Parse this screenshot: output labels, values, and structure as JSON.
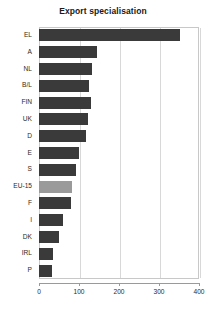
{
  "chart_data": {
    "type": "bar",
    "orientation": "horizontal",
    "title": "Export specialisation",
    "xlabel": "",
    "ylabel": "",
    "categories": [
      "EL",
      "A",
      "NL",
      "B/L",
      "FIN",
      "UK",
      "D",
      "E",
      "S",
      "EU-15",
      "F",
      "I",
      "DK",
      "IRL",
      "P"
    ],
    "values": [
      352,
      146,
      133,
      126,
      129,
      123,
      118,
      101,
      93,
      83,
      80,
      60,
      51,
      34,
      33
    ],
    "xlim": [
      0,
      400
    ],
    "xticks": [
      0,
      100,
      200,
      300,
      400
    ],
    "xtick_labels": [
      "0",
      "100",
      "200",
      "300",
      "400"
    ],
    "grid": true,
    "grid_axis": "x",
    "legend": false,
    "highlight_category": "EU-15",
    "colors": {
      "bar": "#3a3a3a",
      "bar_highlight": "#9a9a9a",
      "gridline": "#d8d8d8",
      "frame": "#c8c8c8",
      "axis": "#9a9a9a",
      "text": "#2a2a2a",
      "title": "#1a1a1a",
      "background": "#ffffff"
    }
  }
}
